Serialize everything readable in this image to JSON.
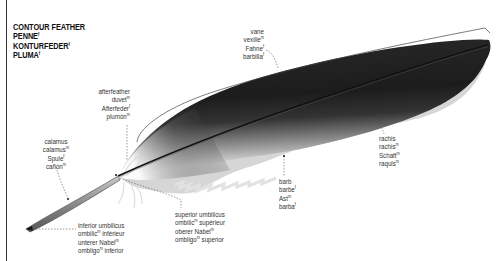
{
  "title": {
    "lines": [
      {
        "text": "CONTOUR FEATHER",
        "gender": ""
      },
      {
        "text": "PENNE",
        "gender": "f"
      },
      {
        "text": "KONTURFEDER",
        "gender": "f"
      },
      {
        "text": "PLUMA",
        "gender": "f"
      }
    ]
  },
  "labels": {
    "vane": [
      {
        "text": "vane",
        "gender": ""
      },
      {
        "text": "vexille",
        "gender": "m"
      },
      {
        "text": "Fahne",
        "gender": "f"
      },
      {
        "text": "barbilla",
        "gender": "f"
      }
    ],
    "afterfeather": [
      {
        "text": "afterfeather",
        "gender": ""
      },
      {
        "text": "duvet",
        "gender": "m"
      },
      {
        "text": "Afterfeder",
        "gender": "f"
      },
      {
        "text": "plumón",
        "gender": "m"
      }
    ],
    "calamus": [
      {
        "text": "calamus",
        "gender": ""
      },
      {
        "text": "calamus",
        "gender": "m"
      },
      {
        "text": "Spule",
        "gender": "f"
      },
      {
        "text": "cañón",
        "gender": "m"
      }
    ],
    "rachis": [
      {
        "text": "rachis",
        "gender": ""
      },
      {
        "text": "rachis",
        "gender": "m"
      },
      {
        "text": "Schaft",
        "gender": "m"
      },
      {
        "text": "raquis",
        "gender": "m"
      }
    ],
    "barb": [
      {
        "text": "barb",
        "gender": ""
      },
      {
        "text": "barbe",
        "gender": "f"
      },
      {
        "text": "Ast",
        "gender": "m"
      },
      {
        "text": "barba",
        "gender": "f"
      }
    ],
    "superior_umbilicus": [
      {
        "text": "superior umbilicus",
        "gender": ""
      },
      {
        "text": "ombilic",
        "gender": "m",
        "suffix": " supérieur"
      },
      {
        "text": "oberer Nabel",
        "gender": "m"
      },
      {
        "text": "ombligo",
        "gender": "m",
        "suffix": " superior"
      }
    ],
    "inferior_umbilicus": [
      {
        "text": "inferior umbilicus",
        "gender": ""
      },
      {
        "text": "ombilic",
        "gender": "m",
        "suffix": " inférieur"
      },
      {
        "text": "unterer Nabel",
        "gender": "m"
      },
      {
        "text": "ombligo",
        "gender": "m",
        "suffix": " inferior"
      }
    ]
  },
  "colors": {
    "vane_dark": "#1a1a1a",
    "vane_mid": "#3a3a3a",
    "vane_light": "#d8d8d8",
    "shaft": "#9a9a9a",
    "leader": "#555555",
    "bracket": "#444444"
  }
}
